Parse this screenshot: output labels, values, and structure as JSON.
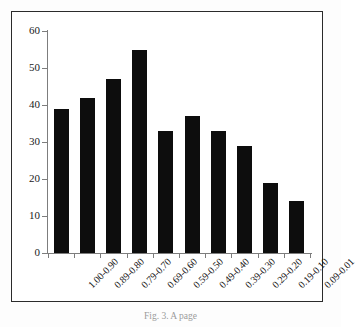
{
  "figure": {
    "caption": "Fig. 3. A page",
    "frame_color": "#2b2b2b",
    "bar_color": "#0d0d0d",
    "axis_color": "#7d7d7d",
    "background": "#ffffff"
  },
  "chart_data": {
    "type": "bar",
    "title": "",
    "subtitle": "",
    "xlabel": "",
    "ylabel": "",
    "categories": [
      "1.00-0.90",
      "0.89-0.80",
      "0.79-0.70",
      "0.69-0.60",
      "0.59-0.50",
      "0.49-0.40",
      "0.39-0.30",
      "0.29-0.20",
      "0.19-0.10",
      "0.09-0.01"
    ],
    "values": [
      39,
      42,
      47,
      55,
      33,
      37,
      33,
      29,
      19,
      14
    ],
    "ylim": [
      0,
      60
    ],
    "ytick_labels": [
      "0",
      "10",
      "20",
      "30",
      "40",
      "50",
      "60"
    ],
    "ytick_values": [
      0,
      10,
      20,
      30,
      40,
      50,
      60
    ],
    "grid": false,
    "legend": null,
    "legend_position": "none",
    "annotations": []
  }
}
